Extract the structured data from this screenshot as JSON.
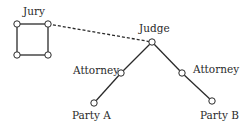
{
  "diagram": {
    "colors": {
      "line": "#2a2a2a",
      "node_fill": "#ffffff",
      "background": "#ffffff"
    },
    "labels": {
      "jury": "Jury",
      "judge": "Judge",
      "attorney_left": "Attorney",
      "attorney_right": "Attorney",
      "party_a": "Party A",
      "party_b": "Party B"
    },
    "nodes": [
      {
        "id": "jury-tl",
        "x": 17,
        "y": 24
      },
      {
        "id": "jury-tr",
        "x": 48,
        "y": 24
      },
      {
        "id": "jury-bl",
        "x": 17,
        "y": 55
      },
      {
        "id": "jury-br",
        "x": 48,
        "y": 55
      },
      {
        "id": "judge",
        "x": 152,
        "y": 42
      },
      {
        "id": "attorney-left",
        "x": 121,
        "y": 73
      },
      {
        "id": "attorney-right",
        "x": 182,
        "y": 73
      },
      {
        "id": "party-a",
        "x": 94,
        "y": 103
      },
      {
        "id": "party-b",
        "x": 212,
        "y": 101
      }
    ],
    "edges": [
      {
        "from": "jury-tl",
        "to": "jury-tr",
        "style": "solid"
      },
      {
        "from": "jury-tr",
        "to": "jury-br",
        "style": "solid"
      },
      {
        "from": "jury-br",
        "to": "jury-bl",
        "style": "solid"
      },
      {
        "from": "jury-bl",
        "to": "jury-tl",
        "style": "solid"
      },
      {
        "from": "jury-tr",
        "to": "judge",
        "style": "dashed"
      },
      {
        "from": "judge",
        "to": "attorney-left",
        "style": "solid"
      },
      {
        "from": "attorney-left",
        "to": "party-a",
        "style": "solid"
      },
      {
        "from": "judge",
        "to": "attorney-right",
        "style": "solid"
      },
      {
        "from": "attorney-right",
        "to": "party-b",
        "style": "solid"
      }
    ]
  }
}
